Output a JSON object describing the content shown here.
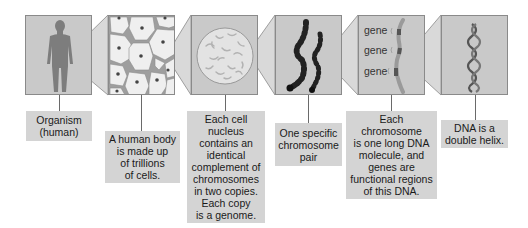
{
  "diagram": {
    "type": "hierarchical zoom sequence",
    "stages": [
      {
        "id": "organism",
        "image": "human-silhouette",
        "label": "Organism\n(human)"
      },
      {
        "id": "cells",
        "image": "cell-tissue",
        "label": "A human body\nis made up\nof trillions\nof cells."
      },
      {
        "id": "nucleus",
        "image": "cell-nucleus-with-chromosomes",
        "label": "Each cell\nnucleus\ncontains an\nidentical\ncomplement of\nchromosomes\nin two copies.\nEach copy\nis a genome."
      },
      {
        "id": "chromosome-pair",
        "image": "chromosome-pair",
        "label": "One specific\nchromosome\npair"
      },
      {
        "id": "genes",
        "image": "chromosome-with-genes",
        "gene_labels": [
          "gene",
          "gene",
          "gene"
        ],
        "label": "Each\nchromosome\nis one long DNA\nmolecule, and\ngenes are\nfunctional regions\nof this DNA."
      },
      {
        "id": "dna",
        "image": "dna-double-helix",
        "label": "DNA is a\ndouble helix."
      }
    ],
    "colors": {
      "panel_bg": "#c9c9c9",
      "connector_bg": "#d9d9d9",
      "label_bg": "#d4d4d4",
      "border": "#8a8a8a",
      "figure": "#7a7a7a"
    }
  }
}
